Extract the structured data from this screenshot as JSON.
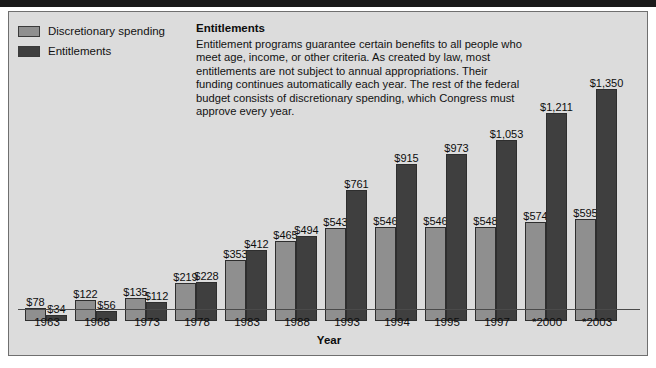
{
  "legend": {
    "items": [
      {
        "label": "Discretionary spending",
        "color": "#8f8f8f",
        "icon": "legend-swatch-light"
      },
      {
        "label": "Entitlements",
        "color": "#3f3f3f",
        "icon": "legend-swatch-dark"
      }
    ]
  },
  "description": {
    "title": "Entitlements",
    "body": "Entitlement programs guarantee certain benefits to all people who meet age, income, or other criteria. As created by law, most entitlements are not subject to annual appropriations. Their funding continues automatically each year. The rest of the federal budget consists of discretionary spending, which Congress must approve every year."
  },
  "chart_data": {
    "type": "bar",
    "title": "",
    "xlabel": "Year",
    "ylabel": "",
    "grid": false,
    "legend_position": "top-left",
    "ylim": [
      0,
      1350
    ],
    "categories": [
      "1963",
      "1968",
      "1973",
      "1978",
      "1983",
      "1988",
      "1993",
      "1994",
      "1995",
      "1997",
      "*2000",
      "*2003"
    ],
    "series": [
      {
        "name": "Discretionary spending",
        "color": "#8f8f8f",
        "values": [
          78,
          122,
          135,
          219,
          353,
          465,
          543,
          546,
          546,
          548,
          574,
          595
        ],
        "labels": [
          "$78",
          "$122",
          "$135",
          "$219",
          "$353",
          "$465",
          "$543",
          "$546",
          "$546",
          "$548",
          "$574",
          "$595"
        ]
      },
      {
        "name": "Entitlements",
        "color": "#3f3f3f",
        "values": [
          34,
          56,
          112,
          228,
          412,
          494,
          761,
          915,
          973,
          1053,
          1211,
          1350
        ],
        "labels": [
          "$34",
          "$56",
          "$112",
          "$228",
          "$412",
          "$494",
          "$761",
          "$915",
          "$973",
          "$1,053",
          "$1,211",
          "$1,350"
        ]
      }
    ]
  }
}
